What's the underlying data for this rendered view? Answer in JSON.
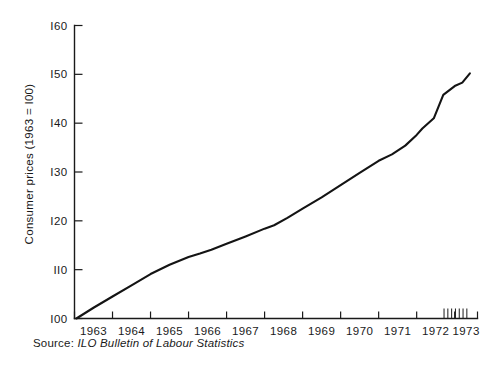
{
  "chart_data": {
    "type": "line",
    "title": "",
    "subtitle": "",
    "xlabel": "",
    "ylabel": "Consumer prices (1963 = I00)",
    "xlim": [
      1963.0,
      1973.6
    ],
    "ylim": [
      100,
      160
    ],
    "grid": false,
    "legend": null,
    "y_ticks": [
      100,
      110,
      120,
      130,
      140,
      150,
      160
    ],
    "y_tick_labels": [
      "I00",
      "II0",
      "I20",
      "I30",
      "I40",
      "I50",
      "I60"
    ],
    "x_ticks": [
      1963,
      1964,
      1965,
      1966,
      1967,
      1968,
      1969,
      1970,
      1971,
      1972,
      1973,
      1973.6
    ],
    "x_tick_labels": [
      "1963",
      "1964",
      "1965",
      "1966",
      "1967",
      "1968",
      "1969",
      "1970",
      "1971",
      "1972",
      "1973"
    ],
    "x_minor_ticks": [
      1972.72,
      1972.82,
      1972.92,
      1973.02,
      1973.12,
      1973.22,
      1973.32
    ],
    "series": [
      {
        "name": "Consumer prices",
        "x": [
          1963.05,
          1963.5,
          1964.0,
          1964.5,
          1965.0,
          1965.5,
          1966.0,
          1966.3,
          1966.6,
          1967.0,
          1967.5,
          1968.0,
          1968.25,
          1968.6,
          1969.0,
          1969.5,
          1970.0,
          1970.5,
          1971.0,
          1971.35,
          1971.7,
          1972.0,
          1972.15,
          1972.45,
          1972.7,
          1973.0,
          1973.2,
          1973.4
        ],
        "y": [
          100.0,
          102.2,
          104.5,
          106.8,
          109.1,
          111.0,
          112.6,
          113.3,
          114.1,
          115.3,
          116.8,
          118.4,
          119.1,
          120.6,
          122.5,
          124.8,
          127.3,
          129.8,
          132.3,
          133.6,
          135.4,
          137.6,
          138.9,
          141.0,
          145.8,
          147.6,
          148.3,
          150.2
        ]
      }
    ],
    "annotations": []
  },
  "source": {
    "label": "Source:",
    "title": "ILO Bulletin of Labour Statistics"
  }
}
